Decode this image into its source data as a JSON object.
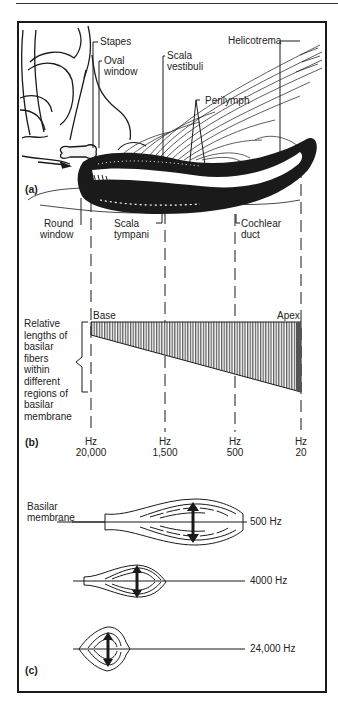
{
  "figure": {
    "panel_a": {
      "tag": "(a)",
      "labels": {
        "stapes": "Stapes",
        "oval_window_1": "Oval",
        "oval_window_2": "window",
        "scala_vestibuli_1": "Scala",
        "scala_vestibuli_2": "vestibuli",
        "helicotrema": "Helicotrema",
        "perilymph": "Perilymph",
        "round_window_1": "Round",
        "round_window_2": "window",
        "scala_tympani_1": "Scala",
        "scala_tympani_2": "tympani",
        "cochlear_duct_1": "Cochlear",
        "cochlear_duct_2": "duct"
      }
    },
    "panel_b": {
      "tag": "(b)",
      "base": "Base",
      "apex": "Apex",
      "side_label": [
        "Relative",
        "lengths of",
        "basilar",
        "fibers",
        "within",
        "different",
        "regions of",
        "basilar",
        "membrane"
      ],
      "ticks": [
        {
          "unit": "Hz",
          "value": "20,000"
        },
        {
          "unit": "Hz",
          "value": "1,500"
        },
        {
          "unit": "Hz",
          "value": "500"
        },
        {
          "unit": "Hz",
          "value": "20"
        }
      ]
    },
    "panel_c": {
      "tag": "(c)",
      "membrane_label_1": "Basilar",
      "membrane_label_2": "membrane",
      "waves": [
        {
          "freq": "500 Hz"
        },
        {
          "freq": "4000 Hz"
        },
        {
          "freq": "24,000 Hz"
        }
      ]
    }
  },
  "colors": {
    "ink": "#1a1a1a",
    "paper": "#ffffff"
  }
}
